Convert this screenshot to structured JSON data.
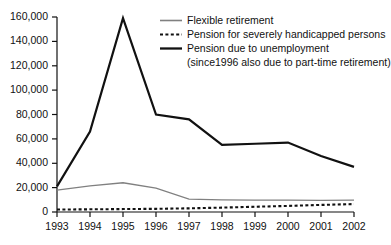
{
  "chart_data": {
    "type": "line",
    "title": "",
    "subtitle": "",
    "xlabel": "",
    "ylabel": "",
    "x": [
      1993,
      1994,
      1995,
      1996,
      1997,
      1998,
      1999,
      2000,
      2001,
      2002
    ],
    "categories": [
      "1993",
      "1994",
      "1995",
      "1996",
      "1997",
      "1998",
      "1999",
      "2000",
      "2001",
      "2002"
    ],
    "xlim": [
      1993,
      2002
    ],
    "ylim": [
      0,
      160000
    ],
    "y_ticks": [
      0,
      20000,
      40000,
      60000,
      80000,
      100000,
      120000,
      140000,
      160000
    ],
    "y_tick_labels": [
      "0",
      "20,000",
      "40,000",
      "60,000",
      "80,000",
      "100,000",
      "120,000",
      "140,000",
      "160,000"
    ],
    "grid": false,
    "legend_position": "top-right",
    "series": [
      {
        "name": "Flexible retirement",
        "style": "solid-thin",
        "color": "#808080",
        "values": [
          18000,
          21500,
          24000,
          19500,
          10500,
          10000,
          9800,
          9700,
          9600,
          9800
        ]
      },
      {
        "name": "Pension for severely handicapped persons",
        "style": "dotted",
        "color": "#111111",
        "values": [
          2000,
          2200,
          2400,
          2600,
          3000,
          3600,
          4300,
          5000,
          5800,
          6500
        ]
      },
      {
        "name": "Pension due to unemployment (since1996 also due to part-time retirement)",
        "style": "solid-thick",
        "color": "#111111",
        "values": [
          21000,
          66000,
          159000,
          80000,
          76000,
          55000,
          56000,
          57000,
          46000,
          37000
        ]
      }
    ]
  },
  "legend": {
    "items": [
      {
        "label": "Flexible retirement",
        "sub_label": "",
        "swatch": "solid-thin-gray-line"
      },
      {
        "label": "Pension for severely handicapped persons",
        "sub_label": "",
        "swatch": "dotted-black-line"
      },
      {
        "label": "Pension due to unemployment",
        "sub_label": "(since1996 also due to part-time retirement)",
        "swatch": "solid-thick-black-line"
      }
    ]
  },
  "colors": {
    "axis": "#111111",
    "series_gray": "#808080",
    "series_black": "#111111",
    "background": "#ffffff"
  }
}
